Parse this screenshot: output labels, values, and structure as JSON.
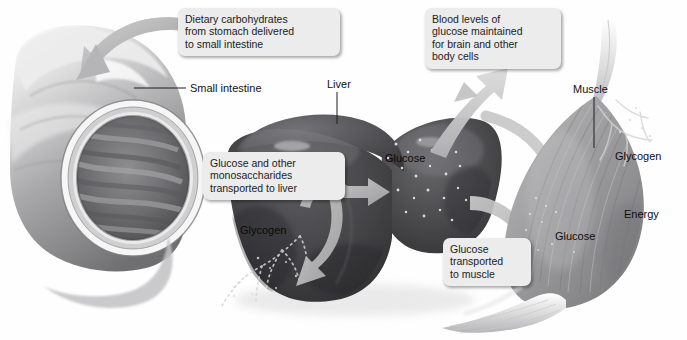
{
  "figure": {
    "background_color": "#ffffff",
    "style": "grayscale medical illustration"
  },
  "callouts": [
    {
      "id": "dietary-carbohydrates",
      "text": "Dietary carbohydrates\nfrom stomach delivered\nto small intestine",
      "x": 178,
      "y": 8,
      "width": 148,
      "tail": "none"
    },
    {
      "id": "blood-glucose",
      "text": "Blood levels of\nglucose maintained\nfor brain and other\nbody cells",
      "x": 425,
      "y": 8,
      "width": 122,
      "tail": "bottom-left"
    },
    {
      "id": "glucose-to-liver",
      "text": "Glucose and other\nmonosaccharides\ntransported to liver",
      "x": 203,
      "y": 152,
      "width": 128,
      "tail": "none"
    },
    {
      "id": "glucose-to-muscle",
      "text": "Glucose\ntransported\nto muscle",
      "x": 443,
      "y": 238,
      "width": 74,
      "tail": "none"
    }
  ],
  "anatomy_labels": [
    {
      "id": "small-intestine",
      "text": "Small intestine",
      "x": 190,
      "y": 82,
      "leader": "horizontal-left"
    },
    {
      "id": "liver",
      "text": "Liver",
      "x": 327,
      "y": 78,
      "leader": "vertical-down"
    },
    {
      "id": "muscle",
      "text": "Muscle",
      "x": 573,
      "y": 83,
      "leader": "vertical-down"
    }
  ],
  "organ_labels": [
    {
      "id": "liver-glucose",
      "text": "Glucose",
      "x": 385,
      "y": 152,
      "organ": "liver"
    },
    {
      "id": "liver-glycogen",
      "text": "Glycogen",
      "x": 240,
      "y": 224,
      "organ": "liver"
    },
    {
      "id": "muscle-glycogen",
      "text": "Glycogen",
      "x": 615,
      "y": 150,
      "organ": "muscle"
    },
    {
      "id": "muscle-energy",
      "text": "Energy",
      "x": 624,
      "y": 208,
      "organ": "muscle"
    },
    {
      "id": "muscle-glucose",
      "text": "Glucose",
      "x": 555,
      "y": 230,
      "organ": "muscle"
    }
  ],
  "organs": [
    {
      "id": "small-intestine",
      "name": "Small intestine",
      "description": "cut-away tube showing lumen with mucosal folds"
    },
    {
      "id": "liver",
      "name": "Liver",
      "description": "two-lobed dark organ with glycogen branching and glucose granules"
    },
    {
      "id": "muscle",
      "name": "Skeletal muscle",
      "description": "fusiform muscle belly with tendons at both ends"
    }
  ],
  "arrows": [
    {
      "id": "arrow-carbs-to-intestine",
      "from": "dietary-carbohydrates",
      "to": "small-intestine",
      "direction": "left-curve"
    },
    {
      "id": "arrow-glucose-to-bloodstream",
      "from": "liver",
      "to": "blood-glucose",
      "direction": "up-right-curve"
    },
    {
      "id": "arrow-glucose-to-glycogen",
      "from": "liver-glucose",
      "to": "liver-glycogen",
      "direction": "down-left-curve"
    },
    {
      "id": "arrow-glycogen-to-glucose",
      "from": "liver-glycogen",
      "to": "liver-glucose",
      "direction": "up-right"
    },
    {
      "id": "arrow-liver-to-muscle",
      "from": "liver",
      "to": "muscle",
      "direction": "right"
    }
  ],
  "colors": {
    "callout_bg": "#ececed",
    "text": "#1b1b1b",
    "arrow_gray": "#b9b9ba",
    "liver_dark": "#4a4a4c",
    "muscle_gray": "#9a9a9c",
    "intestine_gray": "#c9c9ca"
  }
}
